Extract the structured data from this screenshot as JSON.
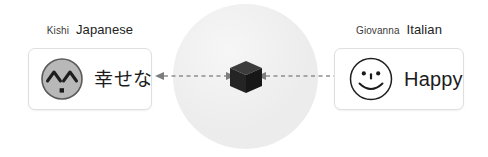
{
  "diagram": {
    "concept_space": {
      "label": "shared-concept-space",
      "fill_color": "#ececec"
    },
    "concept_node": {
      "shape": "cube",
      "label": "abstract-concept",
      "color": "#262626"
    },
    "connectors": [
      {
        "name": "left-link",
        "style": "dashed",
        "heads": "both"
      },
      {
        "name": "right-link",
        "style": "dashed",
        "heads": "both"
      }
    ],
    "speakers": [
      {
        "side": "left",
        "name": "Kishi",
        "language": "Japanese",
        "face_icon": "happy-caret-eyes-face-icon",
        "expression": "幸せな"
      },
      {
        "side": "right",
        "name": "Giovanna",
        "language": "Italian",
        "face_icon": "smiley-face-icon",
        "expression": "Happy"
      }
    ]
  }
}
